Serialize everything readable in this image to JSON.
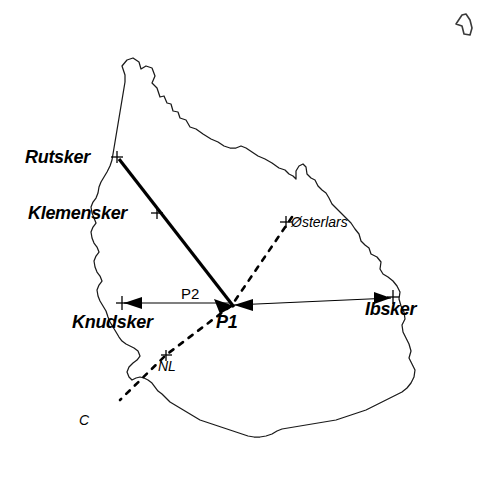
{
  "figure": {
    "background_color": "#ffffff",
    "line_color": "#000000",
    "coast_color": "#1a1a1a",
    "width": 485,
    "height": 489
  },
  "labels": {
    "rutsker": "Rutsker",
    "klemensker": "Klemensker",
    "osterlars": "Østerlars",
    "osterlars_marker": "+",
    "knudsker": "Knudsker",
    "ibsker": "Ibsker",
    "p1": "P1",
    "p2": "P2",
    "nl": "NL",
    "c": "C"
  },
  "markers": [
    {
      "name": "rutsker",
      "x": 117,
      "y": 157
    },
    {
      "name": "klemensker",
      "x": 157,
      "y": 213
    },
    {
      "name": "osterlars",
      "x": 286,
      "y": 222
    },
    {
      "name": "knudsker",
      "x": 122,
      "y": 303
    },
    {
      "name": "ibsker",
      "x": 393,
      "y": 298
    },
    {
      "name": "nl",
      "x": 166,
      "y": 355
    },
    {
      "name": "p1",
      "x": 232,
      "y": 305
    }
  ],
  "lines": [
    {
      "name": "rutsker-to-p1",
      "style": "thick",
      "from": "Rutsker",
      "to": "P1"
    },
    {
      "name": "p1-to-knudsker",
      "style": "thin-arrow",
      "from": "P1",
      "to": "Knudsker"
    },
    {
      "name": "ibsker-to-p1",
      "style": "thin-arrow",
      "from": "Ibsker",
      "to": "P1"
    },
    {
      "name": "osterlars-to-c",
      "style": "dashed",
      "from": "Østerlars",
      "through": "P1, NL",
      "to": "C"
    }
  ]
}
